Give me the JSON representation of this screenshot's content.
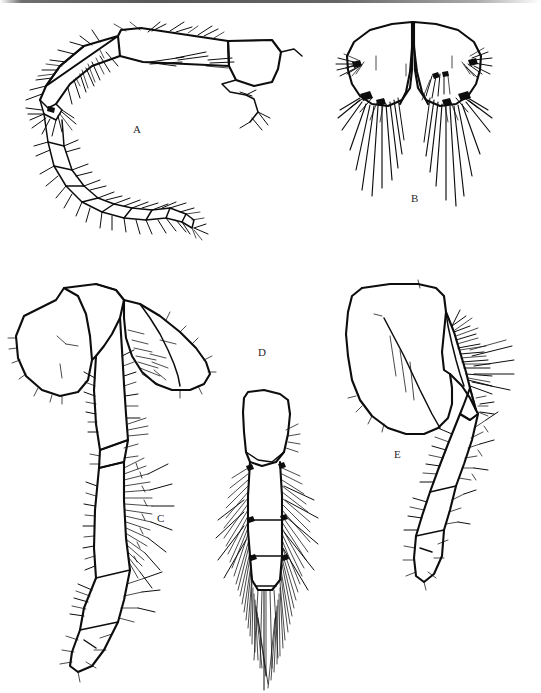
{
  "figure": {
    "kind": "scientific-line-drawing-plate",
    "background_color": "#ffffff",
    "ink_color": "#0d0d0d",
    "width": 541,
    "height": 693,
    "top_scan_artifact": true
  },
  "panels": [
    {
      "id": "A",
      "label": "A",
      "label_x": 133,
      "label_y": 124,
      "subject": "antenna, curved, multi-articulate flagellum with setae",
      "bbox": {
        "x": 18,
        "y": 22,
        "width": 275,
        "height": 215
      }
    },
    {
      "id": "B",
      "label": "B",
      "label_x": 411,
      "label_y": 193,
      "subject": "paired symmetric plates (uropods/telson) bearing long setae",
      "bbox": {
        "x": 330,
        "y": 20,
        "width": 190,
        "height": 200
      }
    },
    {
      "id": "C",
      "label": "C",
      "label_x": 157,
      "label_y": 513,
      "subject": "gnathopod with coxal plate, expanded basis and setose segments",
      "bbox": {
        "x": 10,
        "y": 272,
        "width": 215,
        "height": 395
      }
    },
    {
      "id": "D",
      "label": "D",
      "label_x": 258,
      "label_y": 347,
      "subject": "narrow appendage densely fringed with plumose setae",
      "bbox": {
        "x": 218,
        "y": 388,
        "width": 120,
        "height": 300
      }
    },
    {
      "id": "E",
      "label": "E",
      "label_x": 394,
      "label_y": 449,
      "subject": "pereopod with large rounded coxal plate and setose distal segments",
      "bbox": {
        "x": 345,
        "y": 280,
        "width": 180,
        "height": 300
      }
    }
  ]
}
